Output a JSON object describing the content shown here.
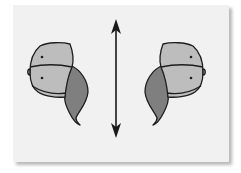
{
  "diagram": {
    "description": "Mirror symmetry illustration: two mirror-image shell-like shapes separated by a vertical double-headed arrow (axis of reflection)",
    "figures": [
      {
        "name": "left-shape",
        "orientation": "original",
        "dots": 2
      },
      {
        "name": "right-shape",
        "orientation": "mirrored",
        "dots": 2
      }
    ],
    "axis": {
      "type": "double-headed-arrow",
      "direction": "vertical"
    },
    "colors": {
      "background": "#f1f1f1",
      "light_fill": "#bdbdbd",
      "dark_fill": "#7f7f7f",
      "outline": "#1e1e1e",
      "arrow": "#1a1a1a"
    }
  }
}
